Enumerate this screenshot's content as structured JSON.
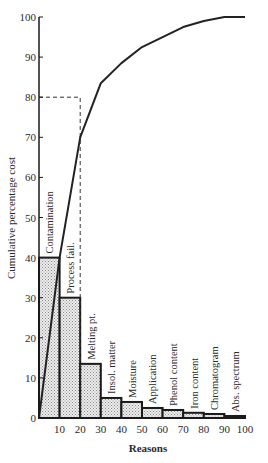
{
  "chart_data": {
    "type": "bar",
    "title": "",
    "xlabel": "Reasons",
    "ylabel": "Cumulative percentage cost",
    "xlim": [
      0,
      100
    ],
    "ylim": [
      0,
      100
    ],
    "x_ticks": [
      10,
      20,
      30,
      40,
      50,
      60,
      70,
      80,
      90,
      100
    ],
    "y_ticks": [
      0,
      10,
      20,
      30,
      40,
      50,
      60,
      70,
      80,
      90,
      100
    ],
    "grid": false,
    "legend": "none",
    "categories": [
      "Contamination",
      "Process fail.",
      "Melting pt.",
      "Insol. matter",
      "Moisture",
      "Application",
      "Phenol content",
      "Iron content",
      "Chromatogram",
      "Abs. spectrum"
    ],
    "bar_x_ranges": [
      [
        0,
        10
      ],
      [
        10,
        20
      ],
      [
        20,
        30
      ],
      [
        30,
        40
      ],
      [
        40,
        50
      ],
      [
        50,
        60
      ],
      [
        60,
        70
      ],
      [
        70,
        80
      ],
      [
        80,
        90
      ],
      [
        90,
        100
      ]
    ],
    "values": [
      40,
      30,
      13.5,
      5,
      4,
      2.5,
      2,
      1.3,
      1,
      0.5
    ],
    "series": [
      {
        "name": "Cumulative percentage",
        "type": "line",
        "x": [
          0,
          10,
          20,
          30,
          40,
          50,
          60,
          70,
          80,
          90,
          100
        ],
        "y": [
          0,
          40,
          70,
          83.5,
          88.5,
          92.5,
          95,
          97.5,
          99,
          100,
          100
        ]
      }
    ],
    "annotations": [
      {
        "type": "dashed-guide",
        "from": [
          0,
          80
        ],
        "corner": [
          20,
          80
        ],
        "to": [
          20,
          0
        ],
        "text": ""
      }
    ]
  }
}
